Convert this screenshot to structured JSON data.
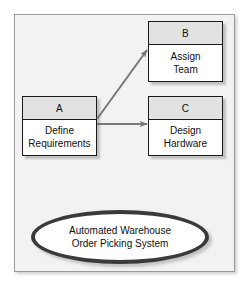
{
  "diagram": {
    "panel": {
      "name": "diagram-panel"
    },
    "boxes": [
      {
        "id": "A",
        "header": "A",
        "line1": "Define",
        "line2": "Requirements"
      },
      {
        "id": "B",
        "header": "B",
        "line1": "Assign",
        "line2": "Team"
      },
      {
        "id": "C",
        "header": "C",
        "line1": "Design",
        "line2": "Hardware"
      }
    ],
    "arrows": [
      {
        "name": "arrow-a-to-b",
        "from": "A",
        "to": "B",
        "style": "diagonal"
      },
      {
        "name": "arrow-a-to-c",
        "from": "A",
        "to": "C",
        "style": "horizontal"
      }
    ],
    "system": {
      "line1": "Automated Warehouse",
      "line2": "Order Picking System"
    },
    "colors": {
      "panel_background": "#f2f2f2",
      "panel_border": "#9a9a9a",
      "box_fill": "#ffffff",
      "box_header_fill": "#e2e2e2",
      "box_border": "#1a1a1a",
      "arrow": "#777777",
      "ellipse_ring": "#3a3a3a",
      "text": "#111111"
    }
  }
}
